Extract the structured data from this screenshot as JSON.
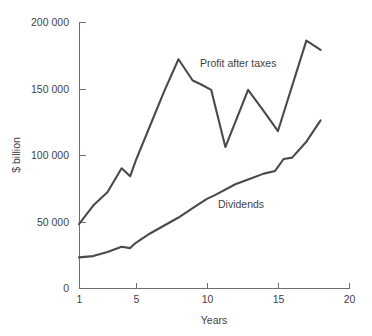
{
  "chart_data": {
    "type": "line",
    "title": "",
    "subtitle": "",
    "xlabel": "Years",
    "ylabel": "$ billion",
    "xlim": [
      1,
      20
    ],
    "ylim": [
      0,
      200000
    ],
    "grid": false,
    "legend_position": "inline-annotation",
    "x_ticks": [
      {
        "value": 1,
        "label": "1"
      },
      {
        "value": 5,
        "label": "5"
      },
      {
        "value": 10,
        "label": "10"
      },
      {
        "value": 15,
        "label": "15"
      },
      {
        "value": 20,
        "label": "20"
      }
    ],
    "y_ticks": [
      {
        "value": 0,
        "label": "0"
      },
      {
        "value": 50000,
        "label": "50 000"
      },
      {
        "value": 100000,
        "label": "100 000"
      },
      {
        "value": 150000,
        "label": "150 000"
      },
      {
        "value": 200000,
        "label": "200 000"
      }
    ],
    "series": [
      {
        "name": "Profit after taxes",
        "annotation": "Profit after taxes",
        "color": "#4a4a4a",
        "x": [
          1,
          2,
          3,
          4,
          4.6,
          5,
          6,
          7,
          8,
          9,
          9.6,
          10.3,
          11.3,
          12.9,
          14,
          15,
          17,
          18
        ],
        "values": [
          48000,
          62000,
          72000,
          90000,
          84000,
          96000,
          122000,
          148000,
          172000,
          156000,
          153000,
          149000,
          106000,
          149000,
          133000,
          118000,
          186000,
          179000
        ]
      },
      {
        "name": "Dividends",
        "annotation": "Dividends",
        "color": "#4a4a4a",
        "x": [
          1,
          2,
          3,
          4,
          4.6,
          5,
          6,
          7,
          8,
          9,
          10,
          10.6,
          12,
          13,
          14,
          14.8,
          15.4,
          16,
          17,
          18
        ],
        "values": [
          23000,
          24000,
          27000,
          31000,
          30000,
          34000,
          41000,
          47000,
          53000,
          60000,
          67000,
          70000,
          78000,
          82000,
          86000,
          88000,
          97000,
          98000,
          110000,
          126000
        ]
      }
    ],
    "annotations": [
      {
        "text": "Profit after taxes",
        "x_px": 200,
        "y_px": 67
      },
      {
        "text": "Dividends",
        "x_px": 218,
        "y_px": 208
      }
    ]
  },
  "plot_geometry": {
    "left_px": 79,
    "right_px": 349,
    "top_px": 22,
    "bottom_px": 288
  }
}
